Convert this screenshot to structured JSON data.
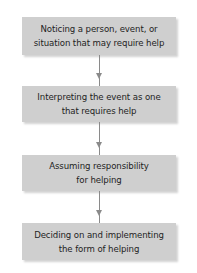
{
  "diagram": {
    "type": "flowchart",
    "direction": "top-to-bottom",
    "colors": {
      "box_fill": "#cfcfcf",
      "arrow": "#8a8a8a",
      "text": "#1e1e1e",
      "background": "#ffffff"
    },
    "steps": [
      {
        "line1": "Noticing a person, event, or",
        "line2": "situation that may require help"
      },
      {
        "line1": "Interpreting the event as one",
        "line2": "that requires help"
      },
      {
        "line1": "Assuming responsibility",
        "line2": "for helping"
      },
      {
        "line1": "Deciding on and implementing",
        "line2": "the form of helping"
      }
    ],
    "connections": [
      {
        "from": 1,
        "to": 2
      },
      {
        "from": 2,
        "to": 3
      },
      {
        "from": 3,
        "to": 4
      }
    ]
  }
}
